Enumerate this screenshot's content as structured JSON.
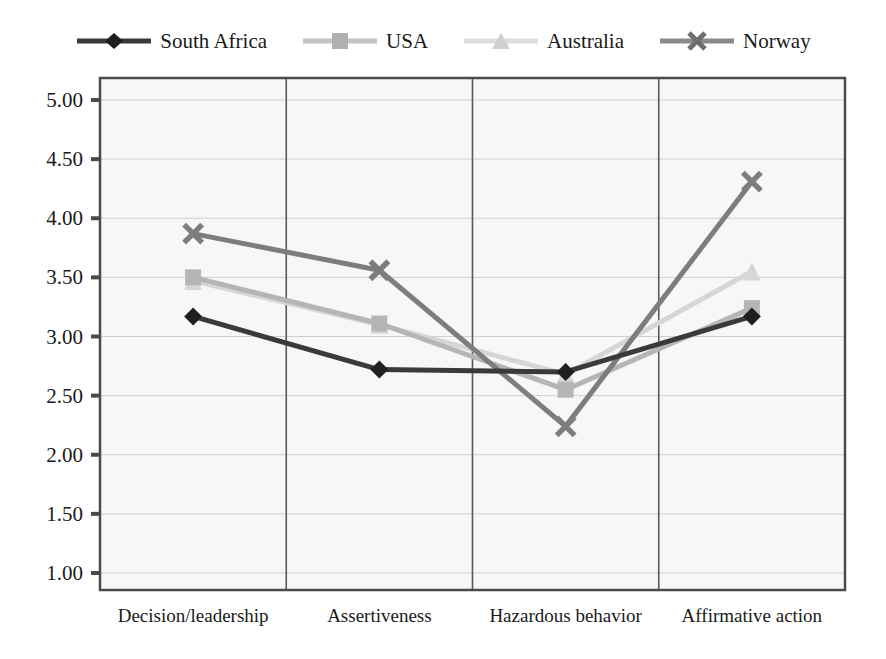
{
  "chart_data": {
    "type": "line",
    "title": "",
    "subtitle": "",
    "xlabel": "",
    "ylabel": "",
    "categories": [
      "Decision/leadership",
      "Assertiveness",
      "Hazardous behavior",
      "Affirmative action"
    ],
    "ylim": [
      1.0,
      5.0
    ],
    "ytick_labels": [
      "5.00",
      "4.50",
      "4.00",
      "3.50",
      "3.00",
      "2.50",
      "2.00",
      "1.50",
      "1.00"
    ],
    "ytick_values": [
      5.0,
      4.5,
      4.0,
      3.5,
      3.0,
      2.5,
      2.0,
      1.5,
      1.0
    ],
    "grid": true,
    "legend_position": "top",
    "series": [
      {
        "name": "South Africa",
        "values": [
          3.17,
          2.72,
          2.7,
          3.17
        ],
        "color": "#3a3a3a",
        "marker": "diamond"
      },
      {
        "name": "USA",
        "values": [
          3.5,
          3.11,
          2.55,
          3.24
        ],
        "color": "#b5b5b5",
        "marker": "square"
      },
      {
        "name": "Australia",
        "values": [
          3.47,
          3.1,
          2.68,
          3.55
        ],
        "color": "#d6d6d6",
        "marker": "triangle"
      },
      {
        "name": "Norway",
        "values": [
          3.87,
          3.56,
          2.24,
          4.31
        ],
        "color": "#7d7d7d",
        "marker": "cross-x"
      }
    ]
  },
  "legend": {
    "items": [
      {
        "label": "South Africa",
        "marker_name": "diamond-marker-icon",
        "color": "#3a3a3a"
      },
      {
        "label": "USA",
        "marker_name": "square-marker-icon",
        "color": "#b5b5b5"
      },
      {
        "label": "Australia",
        "marker_name": "triangle-marker-icon",
        "color": "#d6d6d6"
      },
      {
        "label": "Norway",
        "marker_name": "x-marker-icon",
        "color": "#7d7d7d"
      }
    ]
  },
  "axes": {
    "y_labels": [
      "5.00",
      "4.50",
      "4.00",
      "3.50",
      "3.00",
      "2.50",
      "2.00",
      "1.50",
      "1.00"
    ],
    "x_labels": [
      "Decision/leadership",
      "Assertiveness",
      "Hazardous behavior",
      "Affirmative action"
    ]
  },
  "style": {
    "plot_background": "#f7f7f7",
    "axis_color": "#4a4a4a",
    "grid_color": "#cfcfcf",
    "text_color": "#1a1a1a"
  }
}
